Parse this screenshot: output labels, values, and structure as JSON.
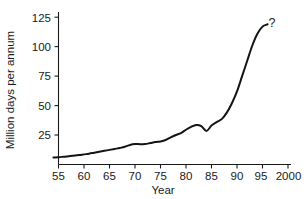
{
  "chart_data": {
    "type": "line",
    "title": "",
    "xlabel": "Year",
    "ylabel": "Million days per annum",
    "xlim": [
      1954,
      2000
    ],
    "ylim": [
      0,
      131
    ],
    "grid": false,
    "legend": null,
    "x_tick_labels": [
      "55",
      "60",
      "65",
      "70",
      "75",
      "80",
      "85",
      "90",
      "95",
      "2000"
    ],
    "x_tick_values": [
      1955,
      1960,
      1965,
      1970,
      1975,
      1980,
      1985,
      1990,
      1995,
      2000
    ],
    "y_tick_labels": [
      "25",
      "50",
      "75",
      "100",
      "125"
    ],
    "y_tick_values": [
      25,
      50,
      75,
      100,
      125
    ],
    "series": [
      {
        "name": "Million days per annum",
        "x": [
          1954,
          1955,
          1956,
          1957,
          1958,
          1959,
          1960,
          1961,
          1962,
          1963,
          1964,
          1965,
          1966,
          1967,
          1968,
          1969,
          1970,
          1971,
          1972,
          1973,
          1974,
          1975,
          1976,
          1977,
          1978,
          1979,
          1980,
          1981,
          1982,
          1983,
          1984,
          1985,
          1986,
          1987,
          1988,
          1989,
          1990,
          1991,
          1992,
          1993,
          1994,
          1995,
          1996
        ],
        "values": [
          6,
          6.2,
          6.6,
          7,
          7.5,
          8,
          8.6,
          9.2,
          10,
          10.8,
          11.6,
          12.4,
          13.2,
          14,
          15,
          16.6,
          17.4,
          17.2,
          17.4,
          18.2,
          19,
          19.6,
          20.8,
          23,
          25,
          26.6,
          29.5,
          32,
          33.6,
          32.6,
          28.5,
          33,
          36,
          38.5,
          44,
          52,
          62,
          75,
          88,
          101,
          111,
          117,
          119
        ]
      }
    ],
    "annotations": [
      {
        "text": "?",
        "x": 1998,
        "y": 123
      }
    ]
  },
  "figure": {
    "axis_color": "#1a1a1a",
    "curve_color": "#141414",
    "background": "#ffffff"
  }
}
